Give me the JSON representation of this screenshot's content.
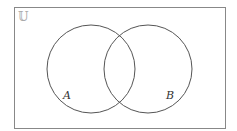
{
  "diagram": {
    "type": "venn",
    "universe_label": "𝕌",
    "sets": [
      {
        "label": "A"
      },
      {
        "label": "B"
      }
    ],
    "colors": {
      "stroke": "#555555",
      "frame": "#888888",
      "background": "#ffffff"
    }
  }
}
